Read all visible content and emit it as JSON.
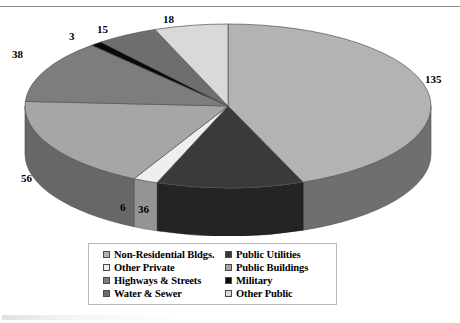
{
  "chart_data": {
    "type": "pie",
    "title": "",
    "total": 307,
    "units": "billions of dollars",
    "labels_shown_on_slices": true,
    "categories": [
      "Non-Residential Bldgs.",
      "Public Utilities",
      "Other Private",
      "Public Buildings",
      "Highways & Streets",
      "Military",
      "Water & Sewer",
      "Other Public"
    ],
    "values": [
      135,
      36,
      6,
      56,
      38,
      3,
      15,
      18
    ],
    "colors": [
      "#b3b3b3",
      "#3a3a3a",
      "#efefef",
      "#a6a6a6",
      "#7d7d7d",
      "#0a0a0a",
      "#6e6e6e",
      "#d9d9d9"
    ],
    "slices": [
      {
        "label": "Non-Residential Bldgs.",
        "value": 135,
        "value_text": "135",
        "color": "#b3b3b3"
      },
      {
        "label": "Public Utilities",
        "value": 36,
        "value_text": "36",
        "color": "#3a3a3a"
      },
      {
        "label": "Other Private",
        "value": 6,
        "value_text": "6",
        "color": "#efefef"
      },
      {
        "label": "Public Buildings",
        "value": 56,
        "value_text": "56",
        "color": "#a6a6a6"
      },
      {
        "label": "Highways & Streets",
        "value": 38,
        "value_text": "38",
        "color": "#7d7d7d"
      },
      {
        "label": "Military",
        "value": 3,
        "value_text": "3",
        "color": "#0a0a0a"
      },
      {
        "label": "Water & Sewer",
        "value": 15,
        "value_text": "15",
        "color": "#6e6e6e"
      },
      {
        "label": "Other Public",
        "value": 18,
        "value_text": "18",
        "color": "#d9d9d9"
      }
    ],
    "legend_position": "bottom",
    "three_d": true
  },
  "value_labels": {
    "non_residential": "135",
    "public_utilities": "36",
    "other_private": "6",
    "public_buildings": "56",
    "highways_streets": "38",
    "military": "3",
    "water_sewer": "15",
    "other_public": "18"
  },
  "legend": {
    "items": [
      {
        "label": "Non-Residential Bldgs.",
        "color": "#b3b3b3"
      },
      {
        "label": "Public Utilities",
        "color": "#3a3a3a"
      },
      {
        "label": "Other Private",
        "color": "#efefef"
      },
      {
        "label": "Public Buildings",
        "color": "#a6a6a6"
      },
      {
        "label": "Highways & Streets",
        "color": "#7d7d7d"
      },
      {
        "label": "Military",
        "color": "#0a0a0a"
      },
      {
        "label": "Water & Sewer",
        "color": "#6e6e6e"
      },
      {
        "label": "Other Public",
        "color": "#d9d9d9"
      }
    ]
  }
}
